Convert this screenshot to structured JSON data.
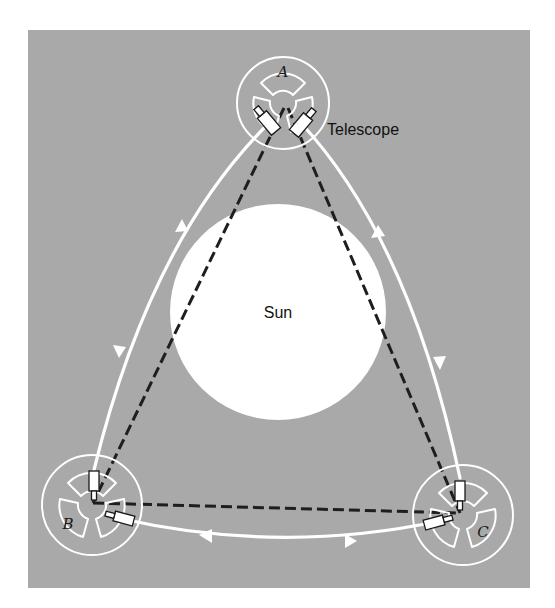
{
  "diagram": {
    "type": "orbital-interferometer-triangle",
    "background_color": "#ffffff",
    "panel_color": "#a9a9a9",
    "sun": {
      "label": "Sun",
      "color": "#ffffff"
    },
    "stations": [
      {
        "id": "A",
        "label": "A",
        "position": "top"
      },
      {
        "id": "B",
        "label": "B",
        "position": "bottom-left"
      },
      {
        "id": "C",
        "label": "C",
        "position": "bottom-right"
      }
    ],
    "callouts": {
      "telescope": "Telescope"
    },
    "beam_style": "dashed",
    "beam_color": "#1e1e1e",
    "orbit_path_color": "#ffffff",
    "arrows": [
      {
        "edge": "A-B",
        "direction": "up"
      },
      {
        "edge": "A-B",
        "direction": "down"
      },
      {
        "edge": "A-C",
        "direction": "up"
      },
      {
        "edge": "A-C",
        "direction": "down"
      },
      {
        "edge": "B-C",
        "direction": "left"
      },
      {
        "edge": "B-C",
        "direction": "right"
      }
    ]
  }
}
